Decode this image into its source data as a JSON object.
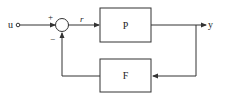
{
  "diagram": {
    "type": "block-diagram",
    "input": {
      "label": "u"
    },
    "output": {
      "label": "y"
    },
    "summing_junction": {
      "plus_sign": "+",
      "minus_sign": "−",
      "output_signal": "r"
    },
    "blocks": [
      {
        "id": "forward",
        "label": "P"
      },
      {
        "id": "feedback",
        "label": "F"
      }
    ],
    "connections": [
      {
        "from": "u",
        "to": "summing_junction",
        "sign": "+"
      },
      {
        "from": "summing_junction",
        "to": "P",
        "signal": "r"
      },
      {
        "from": "P",
        "to": "y"
      },
      {
        "from": "y",
        "to": "F"
      },
      {
        "from": "F",
        "to": "summing_junction",
        "sign": "−"
      }
    ],
    "colors": {
      "stroke": "#333333",
      "background": "#ffffff"
    }
  }
}
